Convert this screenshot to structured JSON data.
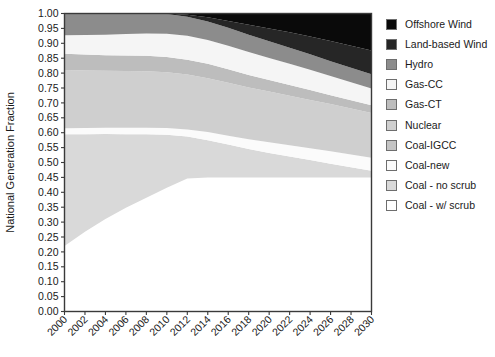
{
  "chart_data": {
    "type": "area",
    "stacked": true,
    "title": "",
    "subtitle": "",
    "xlabel": "",
    "ylabel": "National Generation Fraction",
    "xlim": [
      2000,
      2030
    ],
    "ylim": [
      0.0,
      1.0
    ],
    "grid": false,
    "legend_position": "right",
    "x": [
      2000,
      2002,
      2004,
      2006,
      2008,
      2010,
      2012,
      2014,
      2016,
      2018,
      2020,
      2022,
      2024,
      2026,
      2028,
      2030
    ],
    "xticks": [
      "2000",
      "2002",
      "2004",
      "2006",
      "2008",
      "2010",
      "2012",
      "2014",
      "2016",
      "2018",
      "2020",
      "2022",
      "2024",
      "2026",
      "2028",
      "2030"
    ],
    "yticks": [
      "0.00",
      "0.05",
      "0.10",
      "0.15",
      "0.20",
      "0.25",
      "0.30",
      "0.35",
      "0.40",
      "0.45",
      "0.50",
      "0.55",
      "0.60",
      "0.65",
      "0.70",
      "0.75",
      "0.80",
      "0.85",
      "0.90",
      "0.95",
      "1.00"
    ],
    "ytick_step": 0.05,
    "stack_order_bottom_to_top": [
      "Coal - w/ scrub",
      "Coal - no scrub",
      "Coal-new",
      "Coal-IGCC",
      "Nuclear",
      "Gas-CT",
      "Gas-CC",
      "Hydro",
      "Land-based Wind",
      "Offshore Wind"
    ],
    "series": [
      {
        "name": "Coal - w/ scrub",
        "color": "#ffffff",
        "values": [
          0.22,
          0.268,
          0.31,
          0.348,
          0.382,
          0.415,
          0.446,
          0.45,
          0.45,
          0.45,
          0.45,
          0.45,
          0.45,
          0.45,
          0.45,
          0.45
        ]
      },
      {
        "name": "Coal - no scrub",
        "color": "#d9d9d9",
        "values": [
          0.375,
          0.327,
          0.286,
          0.247,
          0.213,
          0.178,
          0.141,
          0.125,
          0.11,
          0.095,
          0.082,
          0.07,
          0.058,
          0.046,
          0.034,
          0.022
        ]
      },
      {
        "name": "Coal-new",
        "color": "#fbfbfb",
        "values": [
          0.02,
          0.021,
          0.021,
          0.022,
          0.022,
          0.023,
          0.024,
          0.027,
          0.03,
          0.033,
          0.036,
          0.038,
          0.04,
          0.042,
          0.043,
          0.044
        ]
      },
      {
        "name": "Coal-IGCC",
        "color": "#c4c4c4",
        "values": [
          0.0,
          0.0,
          0.0,
          0.0,
          0.0,
          0.0,
          0.0,
          0.0,
          0.0,
          0.0,
          0.0,
          0.0,
          0.0,
          0.0,
          0.0,
          0.0
        ]
      },
      {
        "name": "Nuclear",
        "color": "#cfcfcf",
        "values": [
          0.195,
          0.193,
          0.191,
          0.19,
          0.189,
          0.187,
          0.184,
          0.181,
          0.178,
          0.174,
          0.17,
          0.166,
          0.162,
          0.158,
          0.154,
          0.15
        ]
      },
      {
        "name": "Gas-CT",
        "color": "#bdbdbd",
        "values": [
          0.055,
          0.053,
          0.052,
          0.052,
          0.052,
          0.051,
          0.05,
          0.048,
          0.045,
          0.042,
          0.039,
          0.036,
          0.033,
          0.03,
          0.028,
          0.026
        ]
      },
      {
        "name": "Gas-CC",
        "color": "#f5f5f5",
        "values": [
          0.062,
          0.066,
          0.069,
          0.072,
          0.075,
          0.078,
          0.08,
          0.08,
          0.079,
          0.077,
          0.074,
          0.071,
          0.068,
          0.064,
          0.06,
          0.056
        ]
      },
      {
        "name": "Hydro",
        "color": "#8c8c8c",
        "values": [
          0.073,
          0.072,
          0.071,
          0.069,
          0.067,
          0.066,
          0.064,
          0.062,
          0.06,
          0.058,
          0.056,
          0.054,
          0.052,
          0.05,
          0.049,
          0.048
        ]
      },
      {
        "name": "Land-based Wind",
        "color": "#262626",
        "values": [
          0.0,
          0.0,
          0.0,
          0.0,
          0.0,
          0.002,
          0.007,
          0.014,
          0.023,
          0.033,
          0.043,
          0.052,
          0.06,
          0.068,
          0.074,
          0.08
        ]
      },
      {
        "name": "Offshore Wind",
        "color": "#0a0a0a",
        "values": [
          0.0,
          0.0,
          0.0,
          0.0,
          0.0,
          0.0,
          0.004,
          0.013,
          0.025,
          0.038,
          0.05,
          0.063,
          0.077,
          0.092,
          0.108,
          0.124
        ]
      }
    ]
  },
  "legend": {
    "items": [
      {
        "label": "Offshore Wind",
        "color": "#0a0a0a"
      },
      {
        "label": "Land-based Wind",
        "color": "#262626"
      },
      {
        "label": "Hydro",
        "color": "#8c8c8c"
      },
      {
        "label": "Gas-CC",
        "color": "#f5f5f5"
      },
      {
        "label": "Gas-CT",
        "color": "#bdbdbd"
      },
      {
        "label": "Nuclear",
        "color": "#cfcfcf"
      },
      {
        "label": "Coal-IGCC",
        "color": "#c4c4c4"
      },
      {
        "label": "Coal-new",
        "color": "#fbfbfb"
      },
      {
        "label": "Coal - no scrub",
        "color": "#d9d9d9"
      },
      {
        "label": "Coal - w/ scrub",
        "color": "#ffffff"
      }
    ]
  },
  "axes": {
    "y_title": "National Generation Fraction",
    "frame_color": "#3a3a3a"
  }
}
